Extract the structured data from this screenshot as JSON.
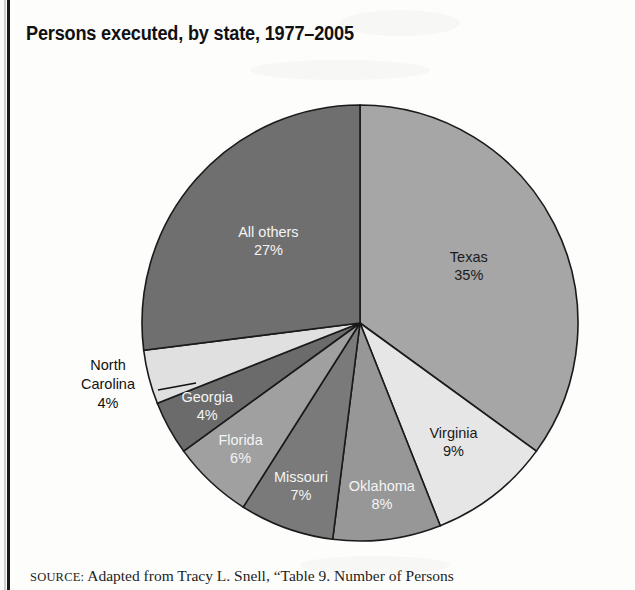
{
  "page": {
    "title": "Persons executed, by state, 1977–2005",
    "background_color": "#fdfdfc",
    "frame_color": "#1b1b1b"
  },
  "source": {
    "prefix": "SOURCE:",
    "text": "Adapted from Tracy L. Snell, “Table 9. Number of Persons"
  },
  "chart_data": {
    "type": "pie",
    "title": "Persons executed, by state, 1977–2005",
    "xlabel": "",
    "ylabel": "",
    "units": "percent",
    "start_angle_deg": 0,
    "direction": "clockwise",
    "legend": "none (labels on slices)",
    "grid": false,
    "categories": [
      "Texas",
      "Virginia",
      "Oklahoma",
      "Missouri",
      "Florida",
      "Georgia",
      "North Carolina",
      "All others"
    ],
    "values": [
      35,
      9,
      8,
      7,
      6,
      4,
      4,
      27
    ],
    "slices": [
      {
        "label": "Texas",
        "value": 35,
        "value_text": "35%",
        "color": "#a6a6a6",
        "text_color": "#1a1a1a",
        "label_placement": "inside"
      },
      {
        "label": "Virginia",
        "value": 9,
        "value_text": "9%",
        "color": "#e6e6e6",
        "text_color": "#1a1a1a",
        "label_placement": "inside"
      },
      {
        "label": "Oklahoma",
        "value": 8,
        "value_text": "8%",
        "color": "#979797",
        "text_color": "#f4f4f4",
        "label_placement": "inside"
      },
      {
        "label": "Missouri",
        "value": 7,
        "value_text": "7%",
        "color": "#7a7a7a",
        "text_color": "#f4f4f4",
        "label_placement": "inside"
      },
      {
        "label": "Florida",
        "value": 6,
        "value_text": "6%",
        "color": "#a0a0a0",
        "text_color": "#f4f4f4",
        "label_placement": "inside"
      },
      {
        "label": "Georgia",
        "value": 4,
        "value_text": "4%",
        "color": "#6b6b6b",
        "text_color": "#f4f4f4",
        "label_placement": "inside"
      },
      {
        "label": "North Carolina",
        "value": 4,
        "value_text": "4%",
        "color": "#e0e0e0",
        "text_color": "#111111",
        "label_placement": "outside-callout"
      },
      {
        "label": "All others",
        "value": 27,
        "value_text": "27%",
        "color": "#6f6f6f",
        "text_color": "#f4f4f4",
        "label_placement": "inside"
      }
    ],
    "geometry": {
      "center_x": 360,
      "center_y": 323,
      "radius": 218,
      "outline_color": "#1a1a1a"
    },
    "callouts": [
      {
        "for": "North Carolina",
        "lines": [
          "North",
          "Carolina",
          "4%"
        ],
        "text_x": 108,
        "text_y": 370,
        "leader_from_x": 158,
        "leader_from_y": 390,
        "leader_to_x": 196,
        "leader_to_y": 383
      }
    ]
  }
}
